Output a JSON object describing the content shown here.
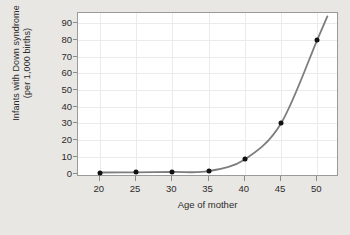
{
  "chart_data": {
    "type": "line",
    "title": "",
    "xlabel": "Age of mother",
    "ylabel": "Infants with Down syndrome (per 1,000 births)",
    "ylabel_line1": "Infants with Down syndrome",
    "ylabel_line2": "(per 1,000 births)",
    "x": [
      20,
      25,
      30,
      35,
      40,
      45,
      50
    ],
    "values": [
      0.7,
      0.8,
      1.0,
      1.5,
      8.5,
      30,
      80
    ],
    "xticks": [
      "20",
      "25",
      "30",
      "35",
      "40",
      "45",
      "50"
    ],
    "yticks": [
      "0",
      "10",
      "20",
      "30",
      "40",
      "50",
      "60",
      "70",
      "80",
      "90"
    ],
    "xlim": [
      17,
      53
    ],
    "ylim": [
      -2,
      96
    ],
    "grid": true,
    "legend": "none",
    "series": [
      {
        "name": "Infants with Down syndrome per 1,000 births",
        "values": [
          0.7,
          0.8,
          1.0,
          1.5,
          8.5,
          30,
          80
        ]
      }
    ],
    "marker": "filled-circle",
    "line_color": "#7d7d7d",
    "marker_color": "#111111",
    "plot_background": "#ffffff",
    "figure_background": "#e9e7e3",
    "frame_color": "#9a9a9a",
    "grid_color": "#eceaea"
  }
}
